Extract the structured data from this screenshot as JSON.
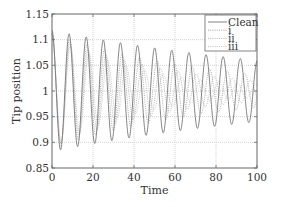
{
  "chart_data": {
    "type": "line",
    "title": "",
    "xlabel": "Time",
    "ylabel": "Tip position",
    "xlim": [
      0,
      100
    ],
    "ylim": [
      0.85,
      1.15
    ],
    "xticks": [
      0,
      20,
      40,
      60,
      80,
      100
    ],
    "xtick_labels": [
      "0",
      "20",
      "40",
      "60",
      "80",
      "100"
    ],
    "yticks": [
      0.85,
      0.9,
      0.95,
      1,
      1.05,
      1.1,
      1.15
    ],
    "ytick_labels": [
      "0.85",
      "0.9",
      "0.95",
      "1",
      "1.05",
      "1.1",
      "1.15"
    ],
    "grid": true,
    "legend_position": "top-right",
    "series": [
      {
        "name": "Clean",
        "style": "solid",
        "color": "#777777",
        "model": {
          "mean": 1.0,
          "amplitude0": 0.118,
          "decay": 0.0068,
          "period": 8.35,
          "phase": 1.5708
        },
        "peaks": [
          [
            0,
            1.115
          ],
          [
            8.3,
            1.113
          ],
          [
            16.6,
            1.108
          ],
          [
            25,
            1.104
          ],
          [
            33.3,
            1.1
          ],
          [
            41.6,
            1.095
          ],
          [
            50,
            1.09
          ],
          [
            58.3,
            1.085
          ],
          [
            66.6,
            1.08
          ],
          [
            75,
            1.075
          ],
          [
            83.3,
            1.07
          ],
          [
            91.6,
            1.066
          ],
          [
            100,
            1.062
          ]
        ],
        "troughs": [
          [
            4.2,
            0.885
          ],
          [
            12.5,
            0.889
          ],
          [
            20.8,
            0.893
          ],
          [
            29.1,
            0.898
          ],
          [
            37.5,
            0.903
          ],
          [
            45.8,
            0.907
          ],
          [
            54.1,
            0.912
          ],
          [
            62.5,
            0.917
          ],
          [
            70.8,
            0.921
          ],
          [
            79.1,
            0.925
          ],
          [
            87.5,
            0.929
          ],
          [
            95.8,
            0.933
          ]
        ]
      },
      {
        "name": "i",
        "style": "dotted",
        "color": "#999999",
        "model": {
          "mean": 1.0,
          "amplitude0": 0.112,
          "decay": 0.0125,
          "period": 8.55,
          "phase": 1.5708
        }
      },
      {
        "name": "ii",
        "style": "dotted",
        "color": "#aaaaaa",
        "model": {
          "mean": 1.0,
          "amplitude0": 0.11,
          "decay": 0.017,
          "period": 8.8,
          "phase": 1.5708
        }
      },
      {
        "name": "iii",
        "style": "dotted",
        "color": "#bbbbbb",
        "model": {
          "mean": 1.0,
          "amplitude0": 0.108,
          "decay": 0.022,
          "period": 9.05,
          "phase": 1.5708
        }
      }
    ]
  }
}
